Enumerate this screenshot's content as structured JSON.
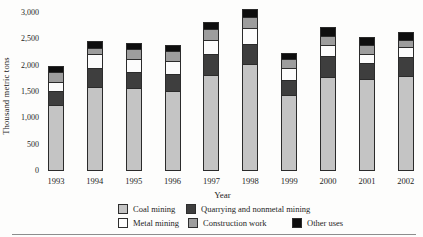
{
  "chart_data": {
    "type": "bar",
    "stacked": true,
    "title": "",
    "xlabel": "Year",
    "ylabel": "Thousand metric tons",
    "ylim": [
      0,
      3000
    ],
    "ytick_step": 500,
    "ytick_labels": [
      "0",
      "500",
      "1,000",
      "1,500",
      "2,000",
      "2,500",
      "3,000"
    ],
    "grid": false,
    "legend_position": "bottom",
    "categories": [
      "1993",
      "1994",
      "1995",
      "1996",
      "1997",
      "1998",
      "1999",
      "2000",
      "2001",
      "2002"
    ],
    "series": [
      {
        "name": "Coal mining",
        "color": "#c4c4c4",
        "values": [
          1250,
          1590,
          1575,
          1510,
          1820,
          2025,
          1435,
          1780,
          1735,
          1800
        ]
      },
      {
        "name": "Quarrying and nonmetal mining",
        "color": "#3e3e3e",
        "values": [
          250,
          360,
          290,
          320,
          385,
          385,
          280,
          385,
          300,
          355
        ]
      },
      {
        "name": "Metal mining",
        "color": "#fcfcfc",
        "values": [
          185,
          255,
          255,
          245,
          270,
          290,
          230,
          210,
          180,
          190
        ]
      },
      {
        "name": "Construction work",
        "color": "#9d9d9d",
        "values": [
          190,
          130,
          195,
          190,
          205,
          210,
          175,
          175,
          160,
          125
        ]
      },
      {
        "name": "Other uses",
        "color": "#0e0e0e",
        "values": [
          85,
          110,
          95,
          90,
          115,
          130,
          85,
          150,
          150,
          145
        ]
      }
    ],
    "totals": [
      1960,
      2445,
      2410,
      2355,
      2795,
      3040,
      2205,
      2700,
      2525,
      2615
    ]
  }
}
